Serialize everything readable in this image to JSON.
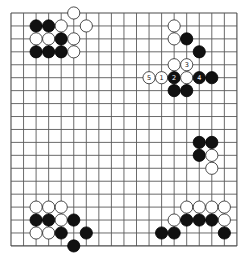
{
  "board": {
    "size": 19,
    "origin_x": 11,
    "origin_y": 13,
    "spacing_x": 12.55,
    "spacing_y": 12.94,
    "stone_radius": 6.1,
    "colors": {
      "background": "#ffffff",
      "line": "#5a5a5a",
      "black_stone": "#111111",
      "white_stone": "#ffffff"
    }
  },
  "stones": [
    {
      "color": "white",
      "col": 5,
      "row": 0
    },
    {
      "color": "black",
      "col": 2,
      "row": 1
    },
    {
      "color": "black",
      "col": 3,
      "row": 1
    },
    {
      "color": "white",
      "col": 4,
      "row": 1
    },
    {
      "color": "white",
      "col": 6,
      "row": 1
    },
    {
      "color": "white",
      "col": 2,
      "row": 2
    },
    {
      "color": "white",
      "col": 3,
      "row": 2
    },
    {
      "color": "black",
      "col": 4,
      "row": 2
    },
    {
      "color": "white",
      "col": 5,
      "row": 2
    },
    {
      "color": "black",
      "col": 2,
      "row": 3
    },
    {
      "color": "black",
      "col": 3,
      "row": 3
    },
    {
      "color": "black",
      "col": 4,
      "row": 3
    },
    {
      "color": "white",
      "col": 5,
      "row": 3
    },
    {
      "color": "white",
      "col": 13,
      "row": 1
    },
    {
      "color": "white",
      "col": 13,
      "row": 2
    },
    {
      "color": "black",
      "col": 14,
      "row": 2
    },
    {
      "color": "black",
      "col": 15,
      "row": 3
    },
    {
      "color": "white",
      "col": 13,
      "row": 4
    },
    {
      "color": "white",
      "col": 14,
      "row": 4,
      "label": "3"
    },
    {
      "color": "white",
      "col": 11,
      "row": 5,
      "label": "5"
    },
    {
      "color": "white",
      "col": 12,
      "row": 5,
      "label": "1"
    },
    {
      "color": "black",
      "col": 13,
      "row": 5,
      "label": "2"
    },
    {
      "color": "white",
      "col": 14,
      "row": 5
    },
    {
      "color": "black",
      "col": 15,
      "row": 5,
      "label": "4"
    },
    {
      "color": "black",
      "col": 16,
      "row": 5
    },
    {
      "color": "black",
      "col": 13,
      "row": 6
    },
    {
      "color": "black",
      "col": 14,
      "row": 6
    },
    {
      "color": "black",
      "col": 15,
      "row": 10
    },
    {
      "color": "black",
      "col": 16,
      "row": 10
    },
    {
      "color": "black",
      "col": 15,
      "row": 11
    },
    {
      "color": "white",
      "col": 16,
      "row": 11
    },
    {
      "color": "white",
      "col": 16,
      "row": 12
    },
    {
      "color": "white",
      "col": 2,
      "row": 15
    },
    {
      "color": "white",
      "col": 3,
      "row": 15
    },
    {
      "color": "white",
      "col": 4,
      "row": 15
    },
    {
      "color": "black",
      "col": 2,
      "row": 16
    },
    {
      "color": "black",
      "col": 3,
      "row": 16
    },
    {
      "color": "white",
      "col": 4,
      "row": 16
    },
    {
      "color": "black",
      "col": 5,
      "row": 16
    },
    {
      "color": "white",
      "col": 2,
      "row": 17
    },
    {
      "color": "white",
      "col": 3,
      "row": 17
    },
    {
      "color": "black",
      "col": 4,
      "row": 17
    },
    {
      "color": "black",
      "col": 6,
      "row": 17
    },
    {
      "color": "black",
      "col": 5,
      "row": 18
    },
    {
      "color": "white",
      "col": 14,
      "row": 15
    },
    {
      "color": "white",
      "col": 15,
      "row": 15
    },
    {
      "color": "white",
      "col": 16,
      "row": 15
    },
    {
      "color": "white",
      "col": 17,
      "row": 15
    },
    {
      "color": "white",
      "col": 13,
      "row": 16
    },
    {
      "color": "black",
      "col": 14,
      "row": 16
    },
    {
      "color": "black",
      "col": 15,
      "row": 16
    },
    {
      "color": "black",
      "col": 16,
      "row": 16
    },
    {
      "color": "white",
      "col": 17,
      "row": 16
    },
    {
      "color": "black",
      "col": 12,
      "row": 17
    },
    {
      "color": "black",
      "col": 13,
      "row": 17
    },
    {
      "color": "black",
      "col": 17,
      "row": 17
    }
  ]
}
